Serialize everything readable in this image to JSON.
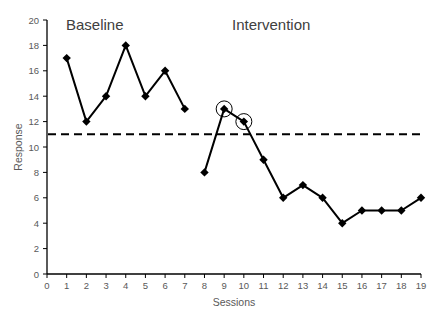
{
  "chart_data": {
    "type": "line",
    "title": "",
    "xlabel": "Sessions",
    "ylabel": "Response",
    "xlim": [
      0,
      19
    ],
    "ylim": [
      0,
      20
    ],
    "xticks": [
      0,
      1,
      2,
      3,
      4,
      5,
      6,
      7,
      8,
      9,
      10,
      11,
      12,
      13,
      14,
      15,
      16,
      17,
      18,
      19
    ],
    "yticks": [
      0,
      2,
      4,
      6,
      8,
      10,
      12,
      14,
      16,
      18,
      20
    ],
    "grid": false,
    "legend": null,
    "series": [
      {
        "name": "Baseline",
        "x": [
          1,
          2,
          3,
          4,
          5,
          6,
          7
        ],
        "values": [
          17,
          12,
          14,
          18,
          14,
          16,
          13
        ],
        "marker": "diamond",
        "color": "#000000"
      },
      {
        "name": "Intervention",
        "x": [
          8,
          9,
          10,
          11,
          12,
          13,
          14,
          15,
          16,
          17,
          18,
          19
        ],
        "values": [
          8,
          13,
          12,
          9,
          6,
          7,
          6,
          4,
          5,
          5,
          5,
          6
        ],
        "marker": "diamond",
        "color": "#000000"
      }
    ],
    "reference_lines": [
      {
        "type": "horizontal",
        "y": 11,
        "style": "dashed",
        "x_from": 0,
        "x_to": 19,
        "color": "#000000"
      }
    ],
    "annotations": [
      {
        "type": "text",
        "text": "Baseline",
        "x": 1,
        "y": 19.4
      },
      {
        "type": "text",
        "text": "Intervention",
        "x": 9.8,
        "y": 19.4
      },
      {
        "type": "circle",
        "x": 9,
        "y": 13
      },
      {
        "type": "circle",
        "x": 10,
        "y": 12
      }
    ]
  },
  "labels": {
    "baseline": "Baseline",
    "intervention": "Intervention",
    "xlabel": "Sessions",
    "ylabel": "Response"
  }
}
